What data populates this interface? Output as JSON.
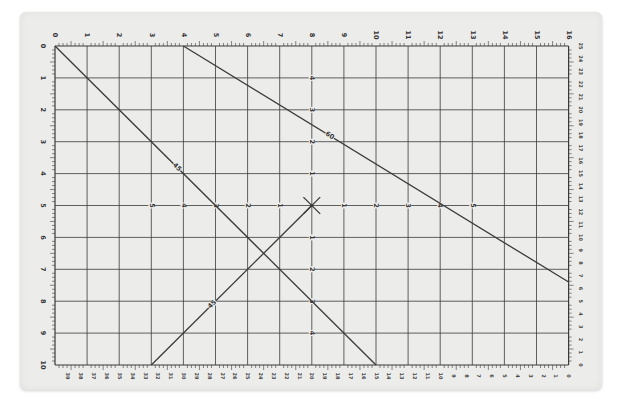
{
  "mat": {
    "description": "Cutting mat grid with measurement scales",
    "background": "#ececeb",
    "line_color": "#3a3a3a",
    "grid": {
      "columns": 16,
      "rows": 10,
      "origin_px": [
        55,
        46
      ],
      "x_step_px": 32.1,
      "y_step_px": 31.9
    },
    "top_scale": [
      "0",
      "1",
      "2",
      "3",
      "4",
      "5",
      "6",
      "7",
      "8",
      "9",
      "10",
      "11",
      "12",
      "13",
      "14",
      "15",
      "16"
    ],
    "left_scale": [
      "0",
      "1",
      "2",
      "3",
      "4",
      "5",
      "6",
      "7",
      "8",
      "9",
      "10"
    ],
    "right_scale": [
      "25",
      "24",
      "23",
      "22",
      "21",
      "20",
      "19",
      "18",
      "17",
      "16",
      "15",
      "14",
      "13",
      "12",
      "11",
      "10",
      "9",
      "8",
      "7",
      "6",
      "5",
      "4",
      "3",
      "2",
      "1",
      "0"
    ],
    "bottom_scale": [
      "40",
      "39",
      "38",
      "37",
      "36",
      "35",
      "34",
      "33",
      "32",
      "31",
      "30",
      "29",
      "28",
      "27",
      "26",
      "25",
      "24",
      "23",
      "22",
      "21",
      "20",
      "19",
      "18",
      "17",
      "16",
      "15",
      "14",
      "13",
      "12",
      "11",
      "10",
      "9",
      "8",
      "7",
      "6",
      "5",
      "4",
      "3",
      "2",
      "1",
      "0"
    ],
    "center_axis_labels": {
      "horizontal": [
        "5",
        "4",
        "3",
        "2",
        "1",
        "",
        "1",
        "2",
        "3",
        "4",
        "5"
      ],
      "vertical": [
        "4",
        "3",
        "2",
        "1",
        "",
        "1",
        "2",
        "3",
        "4"
      ]
    },
    "angle_lines": [
      {
        "label": "45",
        "from": [
          0,
          0
        ],
        "to": [
          10,
          10
        ]
      },
      {
        "label": "60",
        "from": [
          4,
          0
        ],
        "to": [
          16,
          7.4
        ]
      },
      {
        "label": "45",
        "from": [
          3,
          10
        ],
        "to": [
          8,
          5
        ]
      }
    ],
    "center_cross": [
      8,
      5
    ]
  }
}
